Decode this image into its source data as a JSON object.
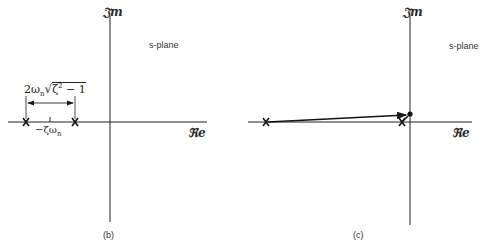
{
  "panels": [
    {
      "id": "b",
      "caption": "(b)",
      "plane_label": "s-plane",
      "imag_axis_label": "𝔍m",
      "real_axis_label": "ℜe",
      "spacing_label": "2ωn√(ζ²−1)",
      "center_label": "−ζωn",
      "poles": 2
    },
    {
      "id": "c",
      "caption": "(c)",
      "plane_label": "s-plane",
      "imag_axis_label": "𝔍m",
      "real_axis_label": "ℜe",
      "poles": 2,
      "point": "test point near origin",
      "vectors": 2
    }
  ],
  "labels": {
    "b_caption": "(b)",
    "c_caption": "(c)",
    "b_plane": "s-plane",
    "c_plane": "s-plane",
    "b_im": "𝔍m",
    "c_im": "𝔍m",
    "b_re": "ℜe",
    "c_re": "ℜe",
    "b_spacing_prefix": "2ω",
    "b_spacing_sub": "n",
    "b_spacing_rad": "ζ",
    "b_spacing_sup": "2",
    "b_spacing_tail": " − 1",
    "b_center": "−ζω",
    "b_center_sub": "n"
  }
}
